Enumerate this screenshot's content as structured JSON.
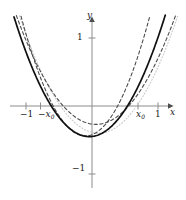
{
  "figure": {
    "background": "#ffffff"
  },
  "axes": {
    "x_axis_label": "x",
    "y_axis_label": "y",
    "axis_color": "#808080",
    "origin_px": {
      "x": 92,
      "y": 106
    },
    "unit_px": {
      "x": 66,
      "y": 68
    },
    "xlim": [
      -1.38,
      1.42
    ],
    "ylim": [
      -1.38,
      1.38
    ],
    "grid": false,
    "arrows": {
      "x_right": true,
      "y_up": true
    }
  },
  "ticks": {
    "x": [
      {
        "label": "−1",
        "value": -1.0,
        "show_tick": true
      },
      {
        "label": "−x",
        "sub": "0",
        "value": -0.78,
        "show_tick": true
      },
      {
        "label": "x",
        "sub": "0",
        "value": 0.7,
        "show_tick": true
      },
      {
        "label": "1",
        "value": 1.0,
        "show_tick": true
      }
    ],
    "y": [
      {
        "label": "1",
        "value": 1.0,
        "show_tick": true
      },
      {
        "label": "−1",
        "value": -1.0,
        "show_tick": true
      }
    ]
  },
  "chart_data": {
    "type": "line",
    "xlabel": "x",
    "ylabel": "y",
    "xlim": [
      -1.38,
      1.42
    ],
    "ylim": [
      -1.38,
      1.38
    ],
    "grid": false,
    "legend_position": "none",
    "annotations": [
      {
        "text": "x₀",
        "x": 0.7,
        "y": 0.0
      },
      {
        "text": "−x₀",
        "x": -0.78,
        "y": 0.0
      },
      {
        "text": "1",
        "x": 1.0,
        "y": 0.0
      },
      {
        "text": "−1",
        "x": -1.0,
        "y": 0.0
      },
      {
        "text": "1",
        "x": 0.0,
        "y": 1.0
      },
      {
        "text": "−1",
        "x": 0.0,
        "y": -1.0
      }
    ],
    "series": [
      {
        "name": "solid-parabola",
        "style": "solid",
        "color": "#111111",
        "width": 1.7,
        "form": "a*(x-h)^2+k",
        "a": 1.35,
        "h": -0.04,
        "k": -0.45,
        "x": [
          -1.06,
          -0.9,
          -0.75,
          -0.6,
          -0.45,
          -0.3,
          -0.15,
          0.0,
          0.15,
          0.3,
          0.45,
          0.6,
          0.75,
          0.9,
          1.06
        ],
        "y": [
          1.03,
          0.58,
          0.23,
          -0.05,
          -0.26,
          -0.39,
          -0.43,
          -0.45,
          -0.4,
          -0.3,
          -0.12,
          0.12,
          0.43,
          0.81,
          1.26
        ]
      },
      {
        "name": "dashed-parabola-shallow",
        "style": "dashed",
        "color": "#4d4d4d",
        "width": 1.1,
        "form": "a*(x-h)^2+k",
        "a": 1.1,
        "h": 0.06,
        "k": -0.27,
        "x": [
          -1.16,
          -1.0,
          -0.8,
          -0.6,
          -0.4,
          -0.2,
          0.0,
          0.2,
          0.4,
          0.6,
          0.8,
          1.0,
          1.16
        ],
        "y": [
          1.31,
          0.97,
          0.57,
          0.25,
          0.0,
          -0.19,
          -0.26,
          -0.25,
          -0.15,
          0.03,
          0.28,
          0.61,
          0.92
        ]
      },
      {
        "name": "dashed-parabola-steep",
        "style": "dashed",
        "color": "#4d4d4d",
        "width": 1.1,
        "form": "a*(x-h)^2+k",
        "a": 1.85,
        "h": -0.1,
        "k": -0.44,
        "x": [
          -1.0,
          -0.85,
          -0.7,
          -0.55,
          -0.4,
          -0.25,
          -0.1,
          0.05,
          0.2,
          0.35,
          0.5,
          0.65,
          0.8,
          0.95,
          1.1
        ],
        "y": [
          1.06,
          0.57,
          0.22,
          -0.07,
          -0.27,
          -0.39,
          -0.44,
          -0.4,
          -0.28,
          -0.07,
          0.22,
          0.58,
          1.02,
          1.41,
          1.51
        ]
      },
      {
        "name": "dotted-parabola-faint",
        "style": "dotted",
        "color": "#c9c9c9",
        "width": 1.1,
        "form": "a*(x-h)^2+k",
        "a": 1.2,
        "h": 0.1,
        "k": -0.4,
        "x": [
          -1.15,
          -1.0,
          -0.8,
          -0.6,
          -0.4,
          -0.2,
          0.0,
          0.2,
          0.4,
          0.6,
          0.8,
          1.0,
          1.2
        ],
        "y": [
          1.36,
          1.05,
          0.57,
          0.19,
          -0.1,
          -0.29,
          -0.39,
          -0.39,
          -0.29,
          -0.1,
          0.19,
          0.57,
          1.05
        ]
      }
    ]
  }
}
